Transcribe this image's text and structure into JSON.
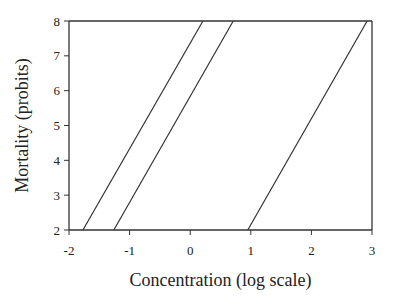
{
  "chart_data": {
    "type": "line",
    "title": "",
    "xlabel": "Concentration (log scale)",
    "ylabel": "Mortality (probits)",
    "xlim": [
      -2,
      3
    ],
    "ylim": [
      2,
      8
    ],
    "xticks": [
      -2,
      -1,
      0,
      1,
      2,
      3
    ],
    "yticks": [
      2,
      3,
      4,
      5,
      6,
      7,
      8
    ],
    "xtick_labels": [
      "-2",
      "-1",
      "0",
      "1",
      "2",
      "3"
    ],
    "ytick_labels": [
      "2",
      "3",
      "4",
      "5",
      "6",
      "7",
      "8"
    ],
    "grid": false,
    "legend": "none",
    "series": [
      {
        "name": "line-1",
        "x": [
          -1.77,
          0.21
        ],
        "y": [
          2,
          8
        ]
      },
      {
        "name": "line-2",
        "x": [
          -1.26,
          0.71
        ],
        "y": [
          2,
          8
        ]
      },
      {
        "name": "line-3",
        "x": [
          0.95,
          2.92
        ],
        "y": [
          2,
          8
        ]
      }
    ]
  }
}
